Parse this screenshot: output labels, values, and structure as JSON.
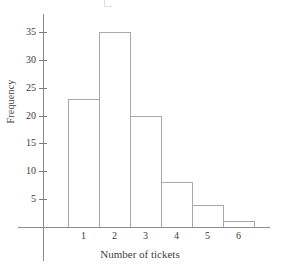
{
  "chart_data": {
    "type": "bar",
    "title": "",
    "subtitle": "",
    "xlabel": "Number of tickets",
    "ylabel": "Frequency",
    "categories": [
      "1",
      "2",
      "3",
      "4",
      "5",
      "6"
    ],
    "values": [
      23,
      35,
      20,
      8,
      4,
      1
    ],
    "series": [
      {
        "name": "Frequency",
        "values": [
          23,
          35,
          20,
          8,
          4,
          1
        ]
      }
    ],
    "ylim": [
      0,
      37
    ],
    "xlim": [
      0.5,
      6.5
    ],
    "y_ticks": [
      5,
      10,
      15,
      20,
      25,
      30,
      35
    ],
    "y_tick_labels": [
      "5",
      "10",
      "15",
      "20",
      "25",
      "30",
      "35"
    ],
    "x_tick_labels": [
      "1",
      "2",
      "3",
      "4",
      "5",
      "6"
    ],
    "grid": false,
    "legend": false,
    "legend_position": "none",
    "bar_style": "histogram-adjacent-outline",
    "colors": {
      "bar_fill": "#ffffff",
      "bar_stroke": "#a8a8a8",
      "axis": "#8c8c8c",
      "text": "#3a3a3a",
      "background": "#ffffff"
    },
    "annotations": []
  }
}
